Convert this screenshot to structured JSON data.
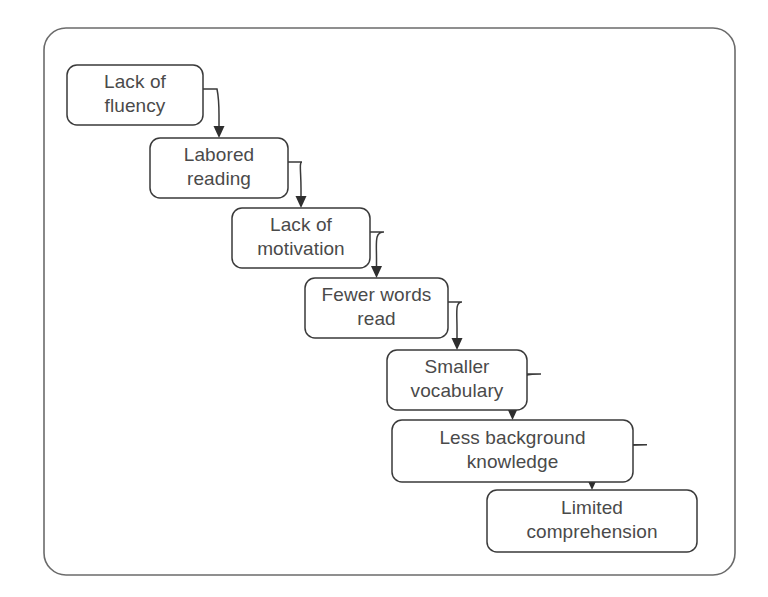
{
  "diagram": {
    "type": "flowchart-cascade",
    "orientation": "top-left to bottom-right descending staircase",
    "background_color": "#ffffff",
    "frame": {
      "name": "outer-border",
      "x": 44,
      "y": 28,
      "width": 691,
      "height": 547,
      "corner_radius": 22,
      "stroke_color": "#6b6b6b",
      "fill": "none"
    },
    "node_style": {
      "fill": "#ffffff",
      "stroke_color": "#3a3a3a",
      "text_color": "#4a4a4a",
      "corner_radius": 10,
      "font_size_px": 19
    },
    "connector_style": {
      "stroke_color": "#3a3a3a",
      "arrowhead": "filled-triangle",
      "shape": "quarter-arc elbow from right edge down to top edge"
    },
    "nodes": [
      {
        "id": "lack-of-fluency",
        "lines": [
          "Lack of",
          "fluency"
        ],
        "text": "Lack of fluency",
        "x": 67,
        "y": 65,
        "width": 136,
        "height": 60,
        "step": 1
      },
      {
        "id": "labored-reading",
        "lines": [
          "Labored",
          "reading"
        ],
        "text": "Labored reading",
        "x": 150,
        "y": 138,
        "width": 138,
        "height": 60,
        "step": 2
      },
      {
        "id": "lack-of-motivation",
        "lines": [
          "Lack of",
          "motivation"
        ],
        "text": "Lack of motivation",
        "x": 232,
        "y": 208,
        "width": 138,
        "height": 60,
        "step": 3
      },
      {
        "id": "fewer-words-read",
        "lines": [
          "Fewer words",
          "read"
        ],
        "text": "Fewer words read",
        "x": 305,
        "y": 278,
        "width": 143,
        "height": 60,
        "step": 4
      },
      {
        "id": "smaller-vocabulary",
        "lines": [
          "Smaller",
          "vocabulary"
        ],
        "text": "Smaller vocabulary",
        "x": 387,
        "y": 350,
        "width": 140,
        "height": 60,
        "step": 5
      },
      {
        "id": "less-background-knowledge",
        "lines": [
          "Less background",
          "knowledge"
        ],
        "text": "Less background knowledge",
        "x": 392,
        "y": 420,
        "width": 241,
        "height": 62,
        "step": 6
      },
      {
        "id": "limited-comprehension",
        "lines": [
          "Limited",
          "comprehension"
        ],
        "text": "Limited comprehension",
        "x": 487,
        "y": 490,
        "width": 210,
        "height": 62,
        "step": 7
      }
    ],
    "connectors": [
      {
        "id": "arrow-1",
        "from": "lack-of-fluency",
        "to": "labored-reading"
      },
      {
        "id": "arrow-2",
        "from": "labored-reading",
        "to": "lack-of-motivation"
      },
      {
        "id": "arrow-3",
        "from": "lack-of-motivation",
        "to": "fewer-words-read"
      },
      {
        "id": "arrow-4",
        "from": "fewer-words-read",
        "to": "smaller-vocabulary"
      },
      {
        "id": "arrow-5",
        "from": "smaller-vocabulary",
        "to": "less-background-knowledge"
      },
      {
        "id": "arrow-6",
        "from": "less-background-knowledge",
        "to": "limited-comprehension"
      }
    ]
  }
}
